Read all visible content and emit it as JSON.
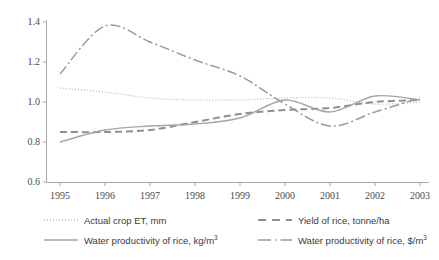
{
  "chart_data": {
    "type": "line",
    "title": "",
    "xlabel": "",
    "ylabel": "",
    "grid": false,
    "legend_position": "bottom",
    "categories": [
      "1995",
      "1996",
      "1997",
      "1998",
      "1999",
      "2000",
      "2001",
      "2002",
      "2003"
    ],
    "xlim": [
      1995,
      2003
    ],
    "ylim": [
      0.6,
      1.4
    ],
    "yticks": [
      "0.6",
      "0.8",
      "1.0",
      "1.2",
      "1.4"
    ],
    "ytick_values": [
      0.6,
      0.8,
      1.0,
      1.2,
      1.4
    ],
    "series": [
      {
        "name": "Actual crop ET, mm",
        "style": "dotted",
        "color": "#bfbfbf",
        "values": [
          1.07,
          1.05,
          1.02,
          1.01,
          1.01,
          1.02,
          1.02,
          0.99,
          1.0
        ]
      },
      {
        "name": "Yield of rice, tonne/ha",
        "style": "dashed",
        "color": "#8f8f8f",
        "values": [
          0.85,
          0.85,
          0.86,
          0.9,
          0.94,
          0.96,
          0.97,
          1.0,
          1.01
        ]
      },
      {
        "name": "Water productivity of rice, kg/m3",
        "style": "solid",
        "color": "#a5a5a5",
        "values": [
          0.8,
          0.86,
          0.88,
          0.89,
          0.92,
          1.01,
          0.95,
          1.03,
          1.01
        ]
      },
      {
        "name": "Water productivity of rice, $/m3",
        "style": "dash-dot",
        "color": "#9a9a9a",
        "values": [
          1.14,
          1.38,
          1.3,
          1.21,
          1.13,
          0.99,
          0.88,
          0.95,
          1.02
        ]
      }
    ]
  },
  "axes": {
    "y_tick_labels": [
      "1.4",
      "1.2",
      "1.0",
      "0.8",
      "0.6"
    ],
    "x_tick_labels": [
      "1995",
      "1996",
      "1997",
      "1998",
      "1999",
      "2000",
      "2001",
      "2002",
      "2003"
    ]
  },
  "legend": {
    "items": [
      {
        "label_main": "Actual crop ET, mm",
        "label_sup": "",
        "icon": "dotted-line-swatch-icon"
      },
      {
        "label_main": "Yield of rice, tonne/ha",
        "label_sup": "",
        "icon": "dashed-line-swatch-icon"
      },
      {
        "label_main": "Water productivity of rice, kg/m",
        "label_sup": "3",
        "icon": "solid-line-swatch-icon"
      },
      {
        "label_main": "Water productivity of rice, $/m",
        "label_sup": "3",
        "icon": "dash-dot-line-swatch-icon"
      }
    ]
  },
  "colors": {
    "axis": "#a9a9a9",
    "text": "#3a3a3a",
    "background": "#ffffff"
  }
}
